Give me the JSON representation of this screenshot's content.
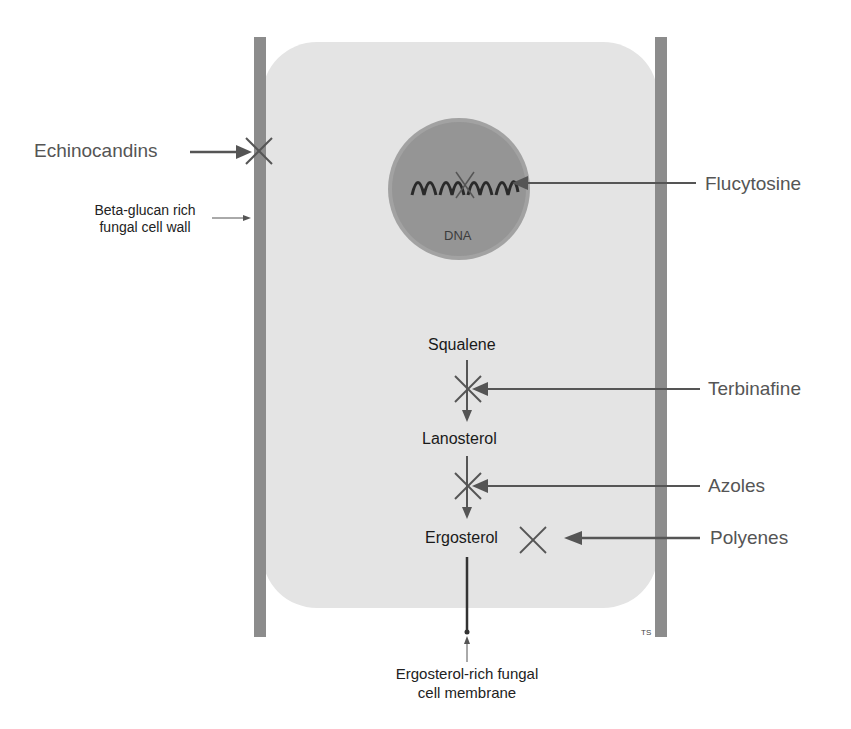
{
  "diagram": {
    "type": "fungal-cell-drug-targets",
    "colors": {
      "cell_fill": "#e4e4e4",
      "cell_wall": "#8c8c8c",
      "nucleus": "#9a9a9a",
      "arrow": "#555555",
      "text_gray": "#555555",
      "text_dark": "#1a1a1a"
    },
    "drugs": {
      "echinocandins": "Echinocandins",
      "flucytosine": "Flucytosine",
      "terbinafine": "Terbinafine",
      "azoles": "Azoles",
      "polyenes": "Polyenes"
    },
    "structures": {
      "cell_wall_line1": "Beta-glucan rich",
      "cell_wall_line2": "fungal cell wall",
      "dna": "DNA",
      "membrane_line1": "Ergosterol-rich fungal",
      "membrane_line2": "cell membrane"
    },
    "pathway": [
      "Squalene",
      "Lanosterol",
      "Ergosterol"
    ],
    "credit": "TS"
  }
}
